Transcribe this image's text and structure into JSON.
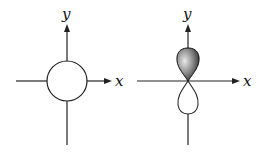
{
  "figure": {
    "panels": [
      {
        "id": "s-orbital",
        "shape": "circle",
        "x_label": "x",
        "y_label": "y"
      },
      {
        "id": "p-orbital",
        "shape": "dumbbell",
        "x_label": "x",
        "y_label": "y",
        "upper_lobe_fill": "#555555",
        "lower_lobe_fill": "#ffffff"
      }
    ]
  }
}
